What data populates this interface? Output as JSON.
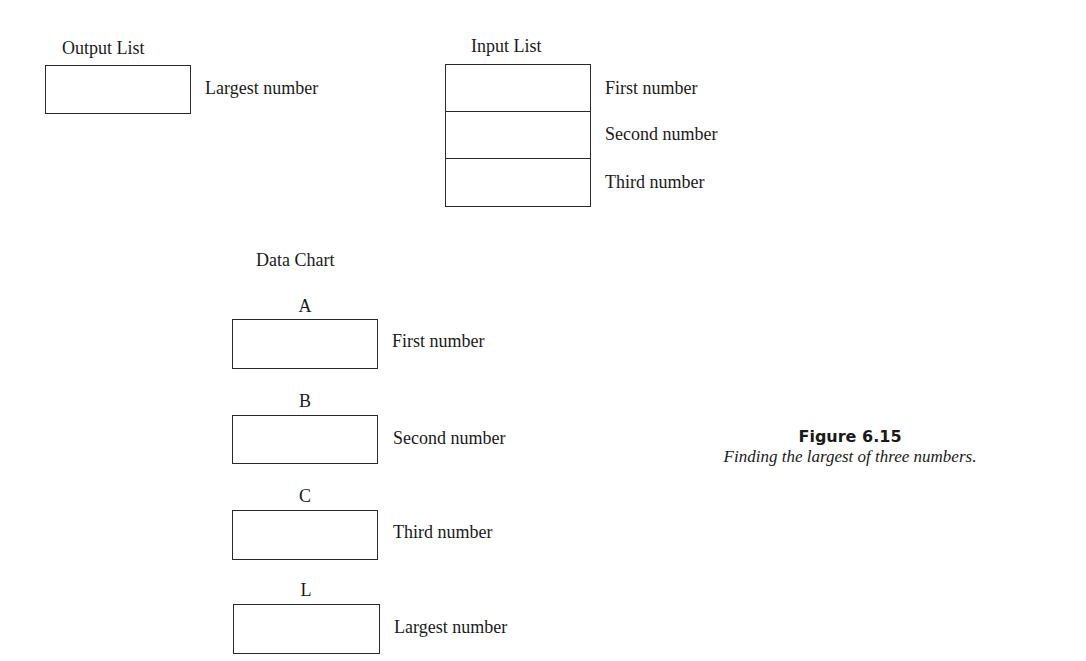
{
  "output_list": {
    "title": "Output List",
    "cells": [
      {
        "label": "Largest number"
      }
    ]
  },
  "input_list": {
    "title": "Input List",
    "cells": [
      {
        "label": "First number"
      },
      {
        "label": "Second number"
      },
      {
        "label": "Third number"
      }
    ]
  },
  "data_chart": {
    "title": "Data Chart",
    "variables": [
      {
        "name": "A",
        "label": "First number"
      },
      {
        "name": "B",
        "label": "Second number"
      },
      {
        "name": "C",
        "label": "Third number"
      },
      {
        "name": "L",
        "label": "Largest number"
      }
    ]
  },
  "figure": {
    "number": "Figure 6.15",
    "caption": "Finding the largest of three numbers."
  }
}
